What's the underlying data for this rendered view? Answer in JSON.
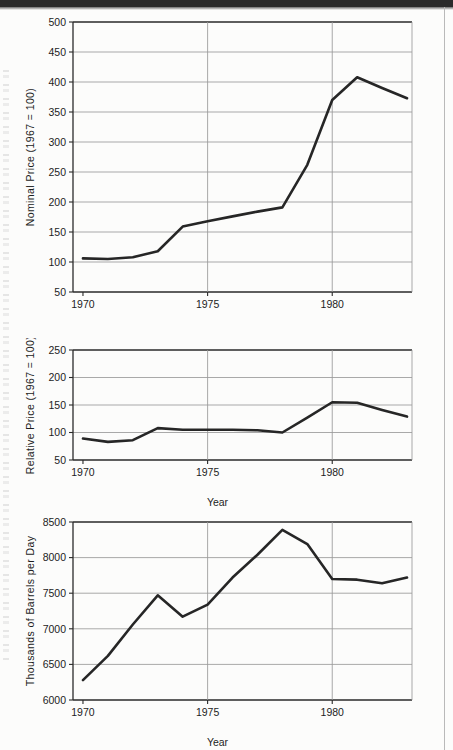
{
  "page": {
    "background_color": "#fcfcfb",
    "ink_color": "#1d1d1d",
    "grid_color": "#9a9a9a",
    "series_color": "#262626"
  },
  "figure": {
    "panels": [
      "(a)",
      "(b)",
      "(c)"
    ],
    "shared_xlabel": "Year"
  },
  "chart_data": [
    {
      "type": "line",
      "panel": "(a)",
      "title": "",
      "xlabel": "Year",
      "ylabel": "Nominal Price (1967 = 100)",
      "xlim": [
        1969.6,
        1983.2
      ],
      "ylim": [
        50,
        500
      ],
      "yticks": [
        50,
        100,
        150,
        200,
        250,
        300,
        350,
        400,
        450,
        500
      ],
      "xticks": [
        1970,
        1975,
        1980
      ],
      "xticklabels": [
        "1970",
        "1975",
        "1980"
      ],
      "grid": "horizontal-and-vertical",
      "legend": "none",
      "x": [
        1970,
        1971,
        1972,
        1973,
        1974,
        1975,
        1976,
        1977,
        1978,
        1979,
        1980,
        1981,
        1982,
        1983
      ],
      "values": [
        106,
        105,
        108,
        118,
        159,
        168,
        176,
        184,
        191,
        262,
        370,
        408,
        390,
        373
      ]
    },
    {
      "type": "line",
      "panel": "(b)",
      "title": "",
      "xlabel": "Year",
      "ylabel": "Relative Price (1967 = 100)",
      "xlim": [
        1969.6,
        1983.2
      ],
      "ylim": [
        50,
        250
      ],
      "yticks": [
        50,
        100,
        150,
        200,
        250
      ],
      "xticks": [
        1970,
        1975,
        1980
      ],
      "xticklabels": [
        "1970",
        "1975",
        "1980"
      ],
      "grid": "horizontal-and-vertical",
      "legend": "none",
      "x": [
        1970,
        1971,
        1972,
        1973,
        1974,
        1975,
        1976,
        1977,
        1978,
        1979,
        1980,
        1981,
        1982,
        1983
      ],
      "values": [
        89,
        83,
        86,
        108,
        105,
        105,
        105,
        104,
        100,
        127,
        155,
        154,
        141,
        129
      ]
    },
    {
      "type": "line",
      "panel": "(c)",
      "title": "",
      "xlabel": "Year",
      "ylabel": "Thousands of Barrels per Day",
      "xlim": [
        1969.6,
        1983.2
      ],
      "ylim": [
        6000,
        8500
      ],
      "yticks": [
        6000,
        6500,
        7000,
        7500,
        8000,
        8500
      ],
      "xticks": [
        1970,
        1975,
        1980
      ],
      "xticklabels": [
        "1970",
        "1975",
        "1980"
      ],
      "grid": "horizontal-and-vertical",
      "legend": "none",
      "x": [
        1970,
        1971,
        1972,
        1973,
        1974,
        1975,
        1976,
        1977,
        1978,
        1979,
        1980,
        1981,
        1982,
        1983
      ],
      "values": [
        6280,
        6620,
        7060,
        7470,
        7170,
        7340,
        7720,
        8040,
        8390,
        8190,
        7700,
        7690,
        7640,
        7720
      ]
    }
  ]
}
